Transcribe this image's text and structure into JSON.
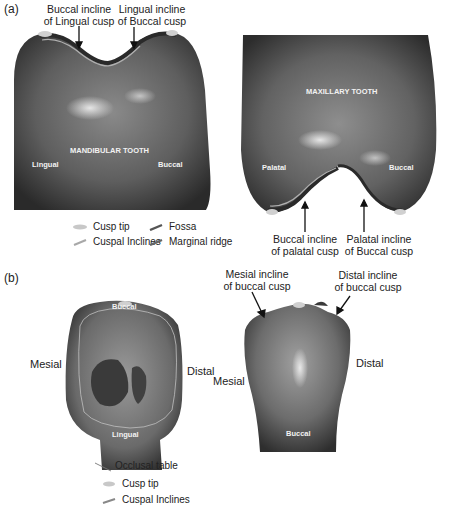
{
  "panel_a": {
    "label": "(a)",
    "mandibular": {
      "title": "MANDIBULAR TOOTH",
      "left_side": "Lingual",
      "right_side": "Buccal",
      "callouts": [
        {
          "line1": "Buccal incline",
          "line2": "of Lingual cusp"
        },
        {
          "line1": "Lingual incline",
          "line2": "of Buccal cusp"
        }
      ]
    },
    "maxillary": {
      "title": "MAXILLARY TOOTH",
      "left_side": "Palatal",
      "right_side": "Buccal",
      "callouts": [
        {
          "line1": "Buccal incline",
          "line2": "of palatal cusp"
        },
        {
          "line1": "Palatal incline",
          "line2": "of Buccal cusp"
        }
      ]
    },
    "legend": [
      {
        "symbol": "cusp-tip",
        "label": "Cusp tip",
        "color": "#c8c8c8"
      },
      {
        "symbol": "fossa",
        "label": "Fossa",
        "color": "#555555"
      },
      {
        "symbol": "cuspal-inclines",
        "label": "Cuspal Inclines",
        "color": "#a8a8a8"
      },
      {
        "symbol": "marginal-ridge",
        "label": "Marginal ridge",
        "color": "#666666"
      }
    ]
  },
  "panel_b": {
    "label": "(b)",
    "occlusal_view": {
      "top": "Buccal",
      "bottom": "Lingual",
      "left": "Mesial",
      "right": "Distal"
    },
    "buccal_view": {
      "left": "Mesial",
      "right": "Distal",
      "bottom": "Buccal",
      "callouts": [
        {
          "line1": "Mesial incline",
          "line2": "of buccal cusp"
        },
        {
          "line1": "Distal incline",
          "line2": "of buccal cusp"
        }
      ]
    },
    "legend": [
      {
        "symbol": "occlusal-table",
        "label": "Occlusal table",
        "color": "#777777"
      },
      {
        "symbol": "cusp-tip",
        "label": "Cusp tip",
        "color": "#c8c8c8"
      },
      {
        "symbol": "cuspal-inclines",
        "label": "Cuspal Inclines",
        "color": "#888888"
      }
    ]
  }
}
